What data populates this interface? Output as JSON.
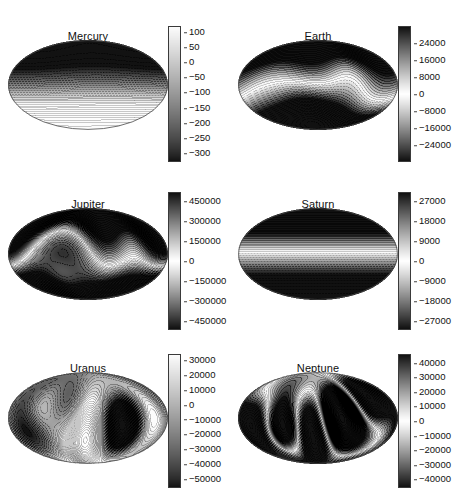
{
  "figure": {
    "caption_fragment": "",
    "projection": "mollweide"
  },
  "chart_data": {
    "type": "heatmap",
    "title": "",
    "xlabel": "",
    "ylabel": "",
    "grid": false,
    "legend_position": "right-of-each-panel",
    "panels": [
      {
        "name": "mercury",
        "title": "Mercury",
        "units_implied": "nT",
        "colorbar": {
          "ticks": [
            100,
            50,
            0,
            -50,
            -100,
            -150,
            -200,
            -250,
            -300
          ],
          "tick_labels": [
            "100",
            "50",
            "0",
            "-50",
            "-100",
            "-150",
            "-200",
            "-250",
            "-300"
          ],
          "vmin": -330,
          "vmax": 120,
          "orientation": "vertical",
          "style": "light-top-dark-bottom"
        },
        "field": {
          "description": "Nearly axisymmetric dipole; dark high-magnitude cap at north pole grading to uniform light southern hemisphere with weak zonal banding.",
          "g10": -1.0,
          "g11": 0.02,
          "h11": 0.01,
          "g20": 0.22,
          "g21": 0.02,
          "h21": 0.0,
          "g22": 0.0,
          "h22": 0.0,
          "g30": 0.05,
          "g31": 0.0,
          "h31": 0.0,
          "g32": 0.0,
          "h32": 0.0,
          "g33": 0.0,
          "h33": 0.0,
          "scale": 215,
          "offset": -105,
          "contour_step": 25
        }
      },
      {
        "name": "earth",
        "title": "Earth",
        "units_implied": "nT",
        "colorbar": {
          "ticks": [
            24000,
            16000,
            8000,
            0,
            -8000,
            -16000,
            -24000
          ],
          "tick_labels": [
            "24000",
            "16000",
            "8000",
            "0",
            "-8000",
            "-16000",
            "-24000"
          ],
          "vmin": -32000,
          "vmax": 32000,
          "orientation": "vertical",
          "style": "dark-light-dark"
        },
        "field": {
          "description": "Axial dipole dominated; broad dark positive band across northern high latitudes, intense concentrated negative anomaly over southern mid-latitudes near lower-left of centre.",
          "g10": 1.0,
          "g11": -0.21,
          "h11": 0.06,
          "g20": -0.06,
          "g21": 0.1,
          "h21": -0.12,
          "g22": 0.05,
          "h22": -0.04,
          "g30": 0.19,
          "g31": -0.07,
          "h31": 0.02,
          "g32": 0.07,
          "h32": -0.03,
          "g33": 0.01,
          "h33": 0.02,
          "scale": 30000,
          "offset": 0,
          "contour_step": 3000
        }
      },
      {
        "name": "jupiter",
        "title": "Jupiter",
        "units_implied": "nT",
        "colorbar": {
          "ticks": [
            450000,
            300000,
            150000,
            0,
            -150000,
            -300000,
            -450000
          ],
          "tick_labels": [
            "450000",
            "300000",
            "150000",
            "0",
            "-150000",
            "-300000",
            "-450000"
          ],
          "vmin": -520000,
          "vmax": 520000,
          "orientation": "vertical",
          "style": "dark-light-dark"
        },
        "field": {
          "description": "Strong tilted dipole with a tight, very dark intense spot just right of centre in the northern hemisphere; wavy contours across mid-latitudes and a grey patch in southern right quadrant.",
          "g10": 1.0,
          "g11": -0.16,
          "h11": 0.24,
          "g20": -0.04,
          "g21": -0.28,
          "h21": 0.18,
          "g22": 0.12,
          "h22": 0.08,
          "g30": 0.2,
          "g31": 0.22,
          "h31": -0.16,
          "g32": 0.14,
          "h32": 0.1,
          "g33": -0.06,
          "h33": 0.04,
          "scale": 470000,
          "offset": 0,
          "contour_step": 37500
        }
      },
      {
        "name": "saturn",
        "title": "Saturn",
        "units_implied": "nT",
        "colorbar": {
          "ticks": [
            27000,
            18000,
            9000,
            0,
            -9000,
            -18000,
            -27000
          ],
          "tick_labels": [
            "27000",
            "18000",
            "9000",
            "0",
            "-9000",
            "-18000",
            "-27000"
          ],
          "vmin": -31000,
          "vmax": 31000,
          "orientation": "vertical",
          "style": "dark-light-dark"
        },
        "field": {
          "description": "Almost perfectly axisymmetric zonal field; purely horizontal contour bands, dark at north pole grading through white at the equator to grey at the south pole.",
          "g10": 1.0,
          "g11": 0.0,
          "h11": 0.0,
          "g20": 0.12,
          "g21": 0.0,
          "h21": 0.0,
          "g22": 0.0,
          "h22": 0.0,
          "g30": 0.05,
          "g31": 0.0,
          "h31": 0.0,
          "g32": 0.0,
          "h32": 0.0,
          "g33": 0.0,
          "h33": 0.0,
          "scale": 29000,
          "offset": 0,
          "contour_step": 3000
        }
      },
      {
        "name": "uranus",
        "title": "Uranus",
        "units_implied": "nT",
        "colorbar": {
          "ticks": [
            30000,
            20000,
            10000,
            0,
            -10000,
            -20000,
            -30000,
            -40000,
            -50000
          ],
          "tick_labels": [
            "30000",
            "20000",
            "10000",
            "0",
            "-10000",
            "-20000",
            "-30000",
            "-40000",
            "-50000"
          ],
          "vmin": -56000,
          "vmax": 34000,
          "orientation": "vertical",
          "style": "light-top-dark-bottom"
        },
        "field": {
          "description": "Highly non-dipolar multipolar field; several closed grey patches in the north and right limb, with a very intense dark negative anomaly in the lower-left quadrant.",
          "g10": -0.25,
          "g11": 0.42,
          "h11": -0.3,
          "g20": 0.3,
          "g21": -0.45,
          "h21": 0.38,
          "g22": 0.5,
          "h22": -0.28,
          "g30": -0.22,
          "g31": 0.34,
          "h31": 0.3,
          "g32": -0.4,
          "h32": 0.26,
          "g33": 0.3,
          "h33": 0.35,
          "scale": 34000,
          "offset": -6000,
          "contour_step": 5000
        }
      },
      {
        "name": "neptune",
        "title": "Neptune",
        "units_implied": "nT",
        "colorbar": {
          "ticks": [
            40000,
            30000,
            20000,
            10000,
            0,
            -10000,
            -20000,
            -30000,
            -40000
          ],
          "tick_labels": [
            "40000",
            "30000",
            "20000",
            "10000",
            "0",
            "-10000",
            "-20000",
            "-30000",
            "-40000"
          ],
          "vmin": -46000,
          "vmax": 46000,
          "orientation": "vertical",
          "style": "dark-light-dark"
        },
        "field": {
          "description": "Strongly multipolar; dark patches on the left limb and upper-right, a small closed ring near the centre, and an intense dark negative anomaly in the lower-left quadrant.",
          "g10": 0.1,
          "g11": 0.48,
          "h11": 0.26,
          "g20": -0.3,
          "g21": 0.36,
          "h21": -0.44,
          "g22": -0.46,
          "h22": 0.3,
          "g30": 0.26,
          "g31": -0.3,
          "h31": -0.34,
          "g32": 0.38,
          "h32": 0.3,
          "g33": -0.34,
          "h33": 0.28,
          "scale": 42000,
          "offset": 0,
          "contour_step": 5000
        }
      }
    ]
  },
  "layout": {
    "panels": [
      {
        "key": "mercury",
        "left": 0,
        "top": 12,
        "map_x": 8,
        "map_y": 28,
        "map_w": 160,
        "map_h": 90,
        "title_top": 18,
        "cbar_x": 168,
        "cbar_y": 14,
        "cbar_w": 13,
        "cbar_h": 136
      },
      {
        "key": "earth",
        "left": 230,
        "top": 12,
        "map_x": 8,
        "map_y": 28,
        "map_w": 160,
        "map_h": 90,
        "title_top": 18,
        "cbar_x": 168,
        "cbar_y": 14,
        "cbar_w": 13,
        "cbar_h": 136
      },
      {
        "key": "jupiter",
        "left": 0,
        "top": 180,
        "map_x": 8,
        "map_y": 28,
        "map_w": 160,
        "map_h": 92,
        "title_top": 18,
        "cbar_x": 168,
        "cbar_y": 12,
        "cbar_w": 13,
        "cbar_h": 138
      },
      {
        "key": "saturn",
        "left": 230,
        "top": 180,
        "map_x": 8,
        "map_y": 28,
        "map_w": 160,
        "map_h": 92,
        "title_top": 18,
        "cbar_x": 168,
        "cbar_y": 12,
        "cbar_w": 13,
        "cbar_h": 138
      },
      {
        "key": "uranus",
        "left": 0,
        "top": 346,
        "map_x": 8,
        "map_y": 26,
        "map_w": 160,
        "map_h": 92,
        "title_top": 16,
        "cbar_x": 168,
        "cbar_y": 8,
        "cbar_w": 13,
        "cbar_h": 134
      },
      {
        "key": "neptune",
        "left": 230,
        "top": 346,
        "map_x": 8,
        "map_y": 26,
        "map_w": 160,
        "map_h": 92,
        "title_top": 16,
        "cbar_x": 168,
        "cbar_y": 8,
        "cbar_w": 13,
        "cbar_h": 134
      }
    ]
  }
}
